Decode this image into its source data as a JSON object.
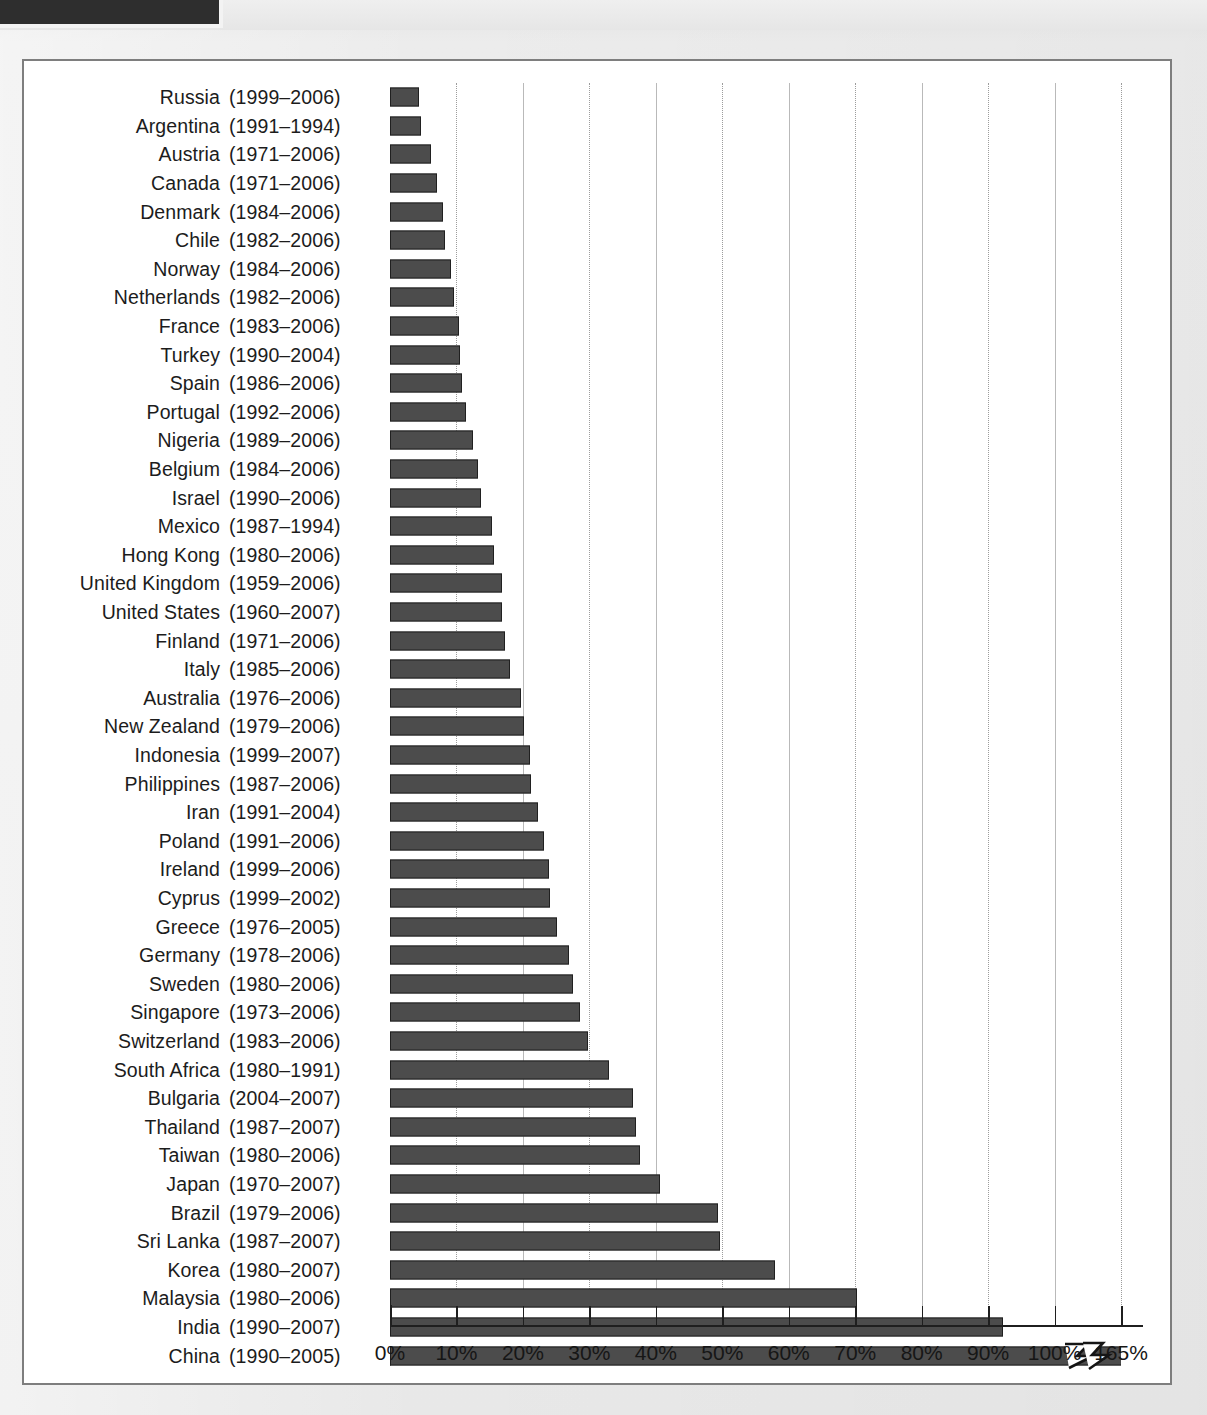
{
  "figure": {
    "frame_border_color": "#7e7e7e",
    "background_color": "#ffffff"
  },
  "chart_data": {
    "type": "bar",
    "orientation": "horizontal",
    "title": "",
    "subtitle": "",
    "xlabel": "",
    "ylabel": "",
    "xlim": [
      0,
      110
    ],
    "grid": true,
    "legend_position": "none",
    "bar_color": "#4c4c4c",
    "bar_border_color": "#202020",
    "axis_note": "Axis is broken: last tick labeled 165% sits one 10%-step beyond the 100% tick.",
    "tick_labels": [
      "0%",
      "10%",
      "20%",
      "30%",
      "40%",
      "50%",
      "60%",
      "70%",
      "80%",
      "90%",
      "100%",
      "165%"
    ],
    "tick_values": [
      0,
      10,
      20,
      30,
      40,
      50,
      60,
      70,
      80,
      90,
      100,
      110
    ],
    "categories": [
      "Russia (1999–2006)",
      "Argentina (1991–1994)",
      "Austria (1971–2006)",
      "Canada (1971–2006)",
      "Denmark (1984–2006)",
      "Chile (1982–2006)",
      "Norway (1984–2006)",
      "Netherlands (1982–2006)",
      "France (1983–2006)",
      "Turkey (1990–2004)",
      "Spain (1986–2006)",
      "Portugal (1992–2006)",
      "Nigeria (1989–2006)",
      "Belgium (1984–2006)",
      "Israel (1990–2006)",
      "Mexico (1987–1994)",
      "Hong Kong (1980–2006)",
      "United Kingdom (1959–2006)",
      "United States (1960–2007)",
      "Finland (1971–2006)",
      "Italy (1985–2006)",
      "Australia (1976–2006)",
      "New Zealand (1979–2006)",
      "Indonesia (1999–2007)",
      "Philippines (1987–2006)",
      "Iran (1991–2004)",
      "Poland (1991–2006)",
      "Ireland (1999–2006)",
      "Cyprus (1999–2002)",
      "Greece (1976–2005)",
      "Germany (1978–2006)",
      "Sweden (1980–2006)",
      "Singapore (1973–2006)",
      "Switzerland (1983–2006)",
      "South Africa (1980–1991)",
      "Bulgaria (2004–2007)",
      "Thailand (1987–2007)",
      "Taiwan (1980–2006)",
      "Japan (1970–2007)",
      "Brazil (1979–2006)",
      "Sri Lanka (1987–2007)",
      "Korea (1980–2007)",
      "Malaysia (1980–2006)",
      "India (1990–2007)",
      "China (1990–2005)"
    ],
    "values": [
      4.4,
      4.6,
      6.2,
      7.0,
      8.0,
      8.3,
      9.2,
      9.7,
      10.4,
      10.6,
      10.9,
      11.5,
      12.5,
      13.3,
      13.7,
      15.4,
      15.7,
      16.8,
      16.9,
      17.3,
      18.1,
      19.7,
      20.1,
      21.1,
      21.2,
      22.3,
      23.1,
      23.9,
      24.1,
      25.1,
      27.0,
      27.6,
      28.6,
      29.8,
      32.9,
      36.5,
      37.0,
      37.6,
      40.6,
      49.3,
      49.7,
      58.0,
      70.2,
      92.3,
      165.0
    ],
    "rows": [
      {
        "country": "Russia",
        "years": "(1999–2006)",
        "value": 4.4
      },
      {
        "country": "Argentina",
        "years": "(1991–1994)",
        "value": 4.6
      },
      {
        "country": "Austria",
        "years": "(1971–2006)",
        "value": 6.2
      },
      {
        "country": "Canada",
        "years": "(1971–2006)",
        "value": 7.0
      },
      {
        "country": "Denmark",
        "years": "(1984–2006)",
        "value": 8.0
      },
      {
        "country": "Chile",
        "years": "(1982–2006)",
        "value": 8.3
      },
      {
        "country": "Norway",
        "years": "(1984–2006)",
        "value": 9.2
      },
      {
        "country": "Netherlands",
        "years": "(1982–2006)",
        "value": 9.7
      },
      {
        "country": "France",
        "years": "(1983–2006)",
        "value": 10.4
      },
      {
        "country": "Turkey",
        "years": "(1990–2004)",
        "value": 10.6
      },
      {
        "country": "Spain",
        "years": "(1986–2006)",
        "value": 10.9
      },
      {
        "country": "Portugal",
        "years": "(1992–2006)",
        "value": 11.5
      },
      {
        "country": "Nigeria",
        "years": "(1989–2006)",
        "value": 12.5
      },
      {
        "country": "Belgium",
        "years": "(1984–2006)",
        "value": 13.3
      },
      {
        "country": "Israel",
        "years": "(1990–2006)",
        "value": 13.7
      },
      {
        "country": "Mexico",
        "years": "(1987–1994)",
        "value": 15.4
      },
      {
        "country": "Hong Kong",
        "years": "(1980–2006)",
        "value": 15.7
      },
      {
        "country": "United Kingdom",
        "years": "(1959–2006)",
        "value": 16.8
      },
      {
        "country": "United States",
        "years": "(1960–2007)",
        "value": 16.9
      },
      {
        "country": "Finland",
        "years": "(1971–2006)",
        "value": 17.3
      },
      {
        "country": "Italy",
        "years": "(1985–2006)",
        "value": 18.1
      },
      {
        "country": "Australia",
        "years": "(1976–2006)",
        "value": 19.7
      },
      {
        "country": "New Zealand",
        "years": "(1979–2006)",
        "value": 20.1
      },
      {
        "country": "Indonesia",
        "years": "(1999–2007)",
        "value": 21.1
      },
      {
        "country": "Philippines",
        "years": "(1987–2006)",
        "value": 21.2
      },
      {
        "country": "Iran",
        "years": "(1991–2004)",
        "value": 22.3
      },
      {
        "country": "Poland",
        "years": "(1991–2006)",
        "value": 23.1
      },
      {
        "country": "Ireland",
        "years": "(1999–2006)",
        "value": 23.9
      },
      {
        "country": "Cyprus",
        "years": "(1999–2002)",
        "value": 24.1
      },
      {
        "country": "Greece",
        "years": "(1976–2005)",
        "value": 25.1
      },
      {
        "country": "Germany",
        "years": "(1978–2006)",
        "value": 27.0
      },
      {
        "country": "Sweden",
        "years": "(1980–2006)",
        "value": 27.6
      },
      {
        "country": "Singapore",
        "years": "(1973–2006)",
        "value": 28.6
      },
      {
        "country": "Switzerland",
        "years": "(1983–2006)",
        "value": 29.8
      },
      {
        "country": "South Africa",
        "years": "(1980–1991)",
        "value": 32.9
      },
      {
        "country": "Bulgaria",
        "years": "(2004–2007)",
        "value": 36.5
      },
      {
        "country": "Thailand",
        "years": "(1987–2007)",
        "value": 37.0
      },
      {
        "country": "Taiwan",
        "years": "(1980–2006)",
        "value": 37.6
      },
      {
        "country": "Japan",
        "years": "(1970–2007)",
        "value": 40.6
      },
      {
        "country": "Brazil",
        "years": "(1979–2006)",
        "value": 49.3
      },
      {
        "country": "Sri Lanka",
        "years": "(1987–2007)",
        "value": 49.7
      },
      {
        "country": "Korea",
        "years": "(1980–2007)",
        "value": 58.0
      },
      {
        "country": "Malaysia",
        "years": "(1980–2006)",
        "value": 70.2
      },
      {
        "country": "India",
        "years": "(1990–2007)",
        "value": 92.3
      },
      {
        "country": "China",
        "years": "(1990–2005)",
        "value": 165.0
      }
    ]
  }
}
